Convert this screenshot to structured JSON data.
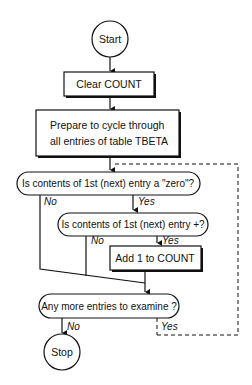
{
  "flowchart": {
    "start": {
      "label": "Start"
    },
    "clear": {
      "label": "Clear COUNT"
    },
    "prepare": {
      "line1": "Prepare to cycle through",
      "line2": "all entries of table TBETA"
    },
    "decision_zero": {
      "label": "Is contents of 1st (next) entry a \"zero\"?",
      "yes": "Yes",
      "no": "No"
    },
    "decision_positive": {
      "label": "Is contents of 1st (next) entry +?",
      "yes": "Yes",
      "no": "No"
    },
    "add": {
      "label": "Add 1 to COUNT"
    },
    "decision_more": {
      "label": "Any more entries to examine ?",
      "yes": "Yes",
      "no": "No"
    },
    "stop": {
      "label": "Stop"
    }
  },
  "colors": {
    "stroke": "#111111",
    "background": "#ffffff"
  }
}
